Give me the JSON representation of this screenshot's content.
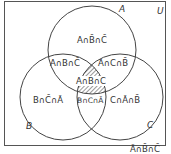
{
  "diagram": {
    "type": "venn",
    "universe_label": "U",
    "sets": [
      {
        "name": "A",
        "label": "A"
      },
      {
        "name": "B",
        "label": "B"
      },
      {
        "name": "C",
        "label": "C"
      }
    ],
    "regions": {
      "a_only": "A∩B̄∩C̄",
      "a_b_notc": "A∩B∩C̄",
      "a_c_notb": "A∩C∩B̄",
      "a_b_c": "A∩B∩C",
      "b_only": "B∩C̄∩Ā",
      "b_c_nota": "B∩C∩Ā",
      "c_only": "C∩Ā∩B̄",
      "none": "Ā∩B̄∩C̄"
    },
    "shaded_region": "A∩B∩C",
    "colors": {
      "line": "#444444",
      "text": "#333333",
      "background": "#ffffff"
    }
  }
}
